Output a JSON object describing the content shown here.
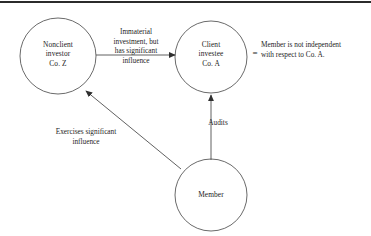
{
  "diagram": {
    "nodes": [
      {
        "id": "nonclient-investor",
        "label": "Nonclient\ninvestor\nCo. Z",
        "shape": "circle"
      },
      {
        "id": "client-investee",
        "label": "Client\ninvestee\nCo. A",
        "shape": "circle"
      },
      {
        "id": "member",
        "label": "Member",
        "shape": "circle"
      }
    ],
    "edges": [
      {
        "id": "investment-edge",
        "from": "nonclient-investor",
        "to": "client-investee",
        "label": "Immaterial\ninvestment, but\nhas significant\ninfluence"
      },
      {
        "id": "influence-edge",
        "from": "member",
        "to": "nonclient-investor",
        "label": "Exercises significant\ninfluence"
      },
      {
        "id": "audits-edge",
        "from": "member",
        "to": "client-investee",
        "label": "Audits"
      }
    ],
    "conclusion": {
      "equals": "=",
      "text": "Member is not independent\nwith respect to Co. A."
    },
    "colors": {
      "stroke": "#4a4a4a",
      "arrow": "#3a3a3a",
      "text": "#1d1d1d",
      "rule": "#2b2b2b",
      "background": "#ffffff"
    }
  }
}
